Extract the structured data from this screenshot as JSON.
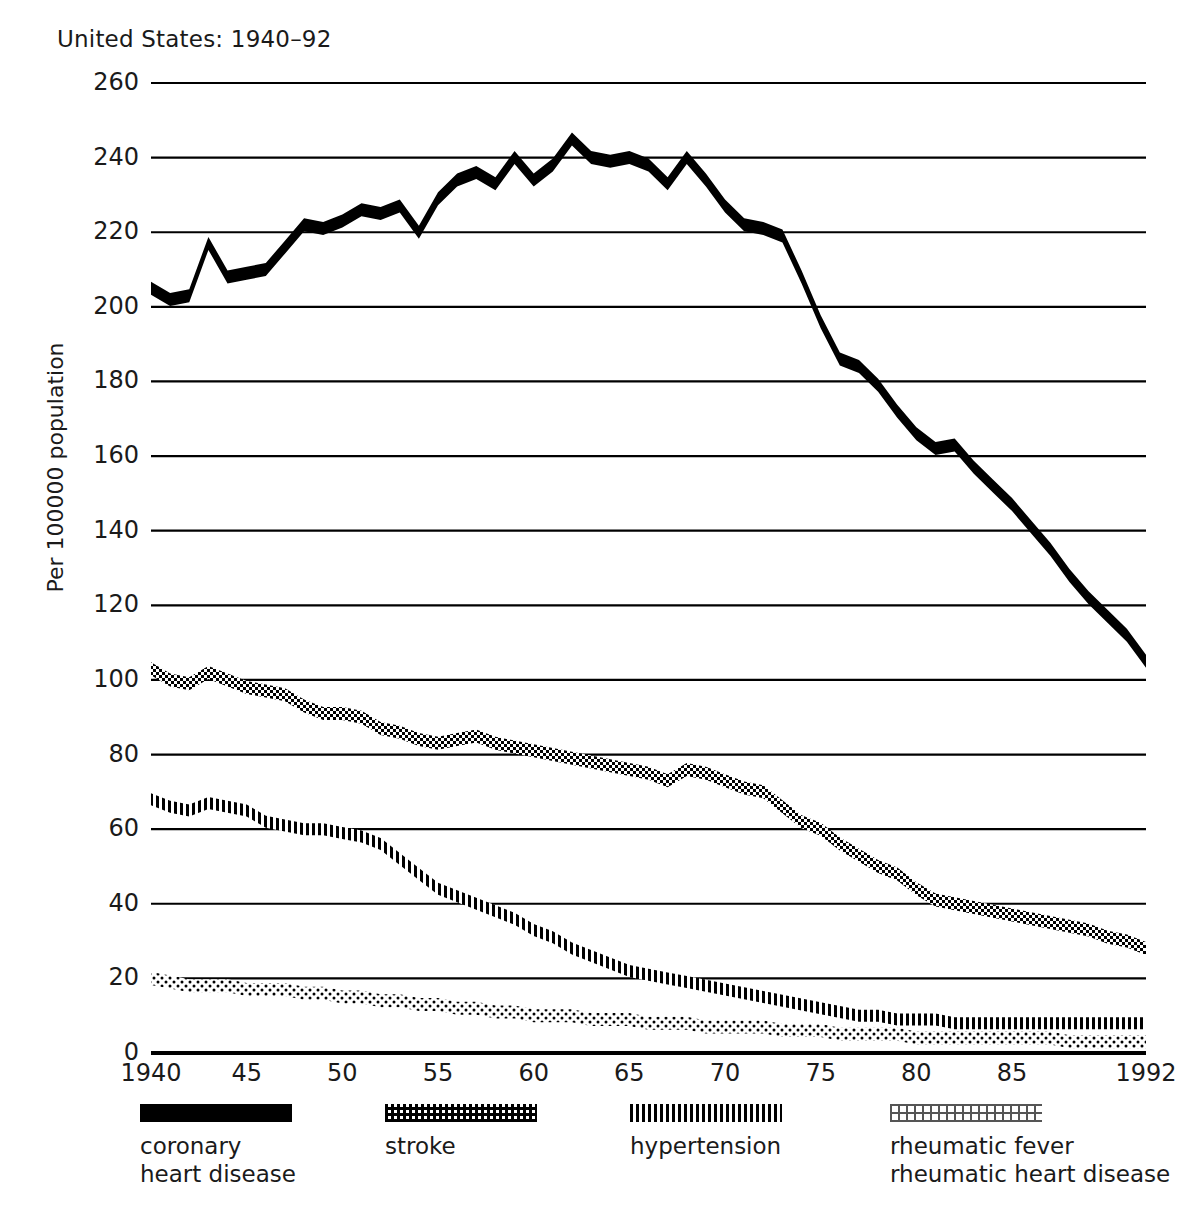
{
  "chart_data": {
    "type": "line",
    "title": "United States: 1940–92",
    "xlabel": "",
    "ylabel": "Per 100000 population",
    "xlim": [
      1940,
      1992
    ],
    "ylim": [
      0,
      260
    ],
    "grid": true,
    "legend_position": "bottom",
    "ytick_labels": [
      "260",
      "240",
      "220",
      "200",
      "180",
      "160",
      "140",
      "120",
      "100",
      "80",
      "60",
      "40",
      "20",
      "0"
    ],
    "ytick_values": [
      260,
      240,
      220,
      200,
      180,
      160,
      140,
      120,
      100,
      80,
      60,
      40,
      20,
      0
    ],
    "xtick_labels": [
      "1940",
      "45",
      "50",
      "55",
      "60",
      "65",
      "70",
      "75",
      "80",
      "85",
      "1992"
    ],
    "xtick_values": [
      1940,
      1945,
      1950,
      1955,
      1960,
      1965,
      1970,
      1975,
      1980,
      1985,
      1992
    ],
    "x": [
      1940,
      1941,
      1942,
      1943,
      1944,
      1945,
      1946,
      1947,
      1948,
      1949,
      1950,
      1951,
      1952,
      1953,
      1954,
      1955,
      1956,
      1957,
      1958,
      1959,
      1960,
      1961,
      1962,
      1963,
      1964,
      1965,
      1966,
      1967,
      1968,
      1969,
      1970,
      1971,
      1972,
      1973,
      1974,
      1975,
      1976,
      1977,
      1978,
      1979,
      1980,
      1981,
      1982,
      1983,
      1984,
      1985,
      1986,
      1987,
      1988,
      1989,
      1990,
      1991,
      1992
    ],
    "series": [
      {
        "name": "coronary heart disease",
        "pattern": "solid",
        "color": "#000000",
        "values": [
          205,
          202,
          203,
          217,
          208,
          209,
          210,
          216,
          222,
          221,
          223,
          226,
          225,
          227,
          220,
          229,
          234,
          236,
          233,
          240,
          234,
          238,
          245,
          240,
          239,
          240,
          238,
          233,
          240,
          234,
          227,
          222,
          221,
          219,
          208,
          196,
          186,
          184,
          179,
          172,
          166,
          162,
          163,
          157,
          152,
          147,
          141,
          135,
          128,
          122,
          117,
          112,
          105
        ]
      },
      {
        "name": "stroke",
        "pattern": "checker",
        "color": "#000000",
        "values": [
          103,
          100,
          99,
          102,
          100,
          98,
          97,
          96,
          93,
          91,
          91,
          90,
          87,
          86,
          84,
          83,
          84,
          85,
          83,
          82,
          81,
          80,
          79,
          78,
          77,
          76,
          75,
          73,
          76,
          75,
          73,
          71,
          70,
          66,
          62,
          60,
          56,
          53,
          50,
          48,
          44,
          41,
          40,
          39,
          38,
          37,
          36,
          35,
          34,
          33,
          31,
          30,
          28
        ]
      },
      {
        "name": "hypertension",
        "pattern": "vertical",
        "color": "#000000",
        "values": [
          68,
          66,
          65,
          67,
          66,
          65,
          62,
          61,
          60,
          60,
          59,
          58,
          56,
          52,
          48,
          44,
          42,
          40,
          38,
          36,
          33,
          31,
          28,
          26,
          24,
          22,
          21,
          20,
          19,
          18,
          17,
          16,
          15,
          14,
          13,
          12,
          11,
          10,
          10,
          9,
          9,
          9,
          8,
          8,
          8,
          8,
          8,
          8,
          8,
          8,
          8,
          8,
          8
        ]
      },
      {
        "name": "rheumatic fever rheumatic heart disease",
        "pattern": "dots",
        "color": "#000000",
        "values": [
          20,
          19,
          18,
          18,
          18,
          17,
          17,
          17,
          16,
          16,
          15,
          15,
          14,
          14,
          13,
          13,
          12,
          12,
          11,
          11,
          10,
          10,
          10,
          9,
          9,
          9,
          8,
          8,
          8,
          7,
          7,
          7,
          7,
          6,
          6,
          6,
          5,
          5,
          5,
          5,
          4,
          4,
          4,
          4,
          4,
          4,
          4,
          4,
          3,
          3,
          3,
          3,
          3
        ]
      }
    ]
  },
  "legend": {
    "items": [
      {
        "label_lines": [
          "coronary",
          "heart disease"
        ],
        "pattern": "solid"
      },
      {
        "label_lines": [
          "stroke"
        ],
        "pattern": "checker"
      },
      {
        "label_lines": [
          "hypertension"
        ],
        "pattern": "vertical"
      },
      {
        "label_lines": [
          "rheumatic fever",
          "rheumatic heart disease"
        ],
        "pattern": "dots"
      }
    ]
  }
}
